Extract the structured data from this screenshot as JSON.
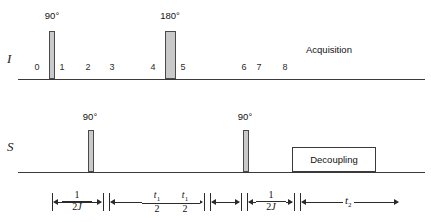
{
  "diagram": {
    "channels": [
      {
        "id": "I",
        "label": "I"
      },
      {
        "id": "S",
        "label": "S"
      }
    ],
    "colors": {
      "pulse_fill": "#c9c9c9",
      "pulse_stroke": "#4a4a4a",
      "line": "#2b2b2b",
      "text": "#111111",
      "background": "#ffffff"
    }
  },
  "channel_I": {
    "name": "I",
    "pulses": [
      {
        "flip_label": "90°",
        "width_px": 6,
        "height_px": 48
      },
      {
        "flip_label": "180°",
        "width_px": 11,
        "height_px": 48
      }
    ],
    "tick_numbers": [
      "0",
      "1",
      "2",
      "3",
      "4",
      "5",
      "6",
      "7",
      "8"
    ],
    "acquisition_label": "Acquisition"
  },
  "channel_S": {
    "name": "S",
    "pulses": [
      {
        "flip_label": "90°",
        "width_px": 6,
        "height_px": 42
      },
      {
        "flip_label": "90°",
        "width_px": 6,
        "height_px": 42
      }
    ],
    "decoupling_label": "Decoupling"
  },
  "timing": {
    "intervals": [
      {
        "id": "delay-1",
        "numerator": "1",
        "denominator": "2J",
        "kind": "fraction"
      },
      {
        "id": "evolution-1",
        "numerator": "t1",
        "denominator": "2",
        "kind": "fraction"
      },
      {
        "id": "evolution-2",
        "numerator": "t1",
        "denominator": "2",
        "kind": "fraction"
      },
      {
        "id": "delay-2",
        "numerator": "1",
        "denominator": "2J",
        "kind": "fraction"
      },
      {
        "id": "acquisition-time",
        "symbol": "t2",
        "kind": "symbol"
      }
    ]
  }
}
